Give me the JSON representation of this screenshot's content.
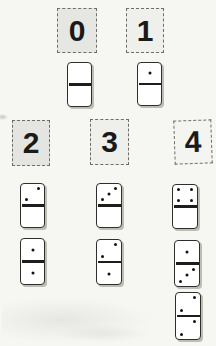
{
  "colors": {
    "background": "#f6f6f3",
    "card_border": "#6e6e68",
    "number": "#1a1a1a",
    "domino_border": "#2e2e2a",
    "domino_face": "#ffffff",
    "divider": "#1d1d1a",
    "pip": "#121212",
    "shadow": "#bdbdb6"
  },
  "cards": [
    {
      "label": "0",
      "x": 57,
      "y": 8,
      "w": 40,
      "h": 45,
      "bg": "#e6e6e2",
      "tilt": 0
    },
    {
      "label": "1",
      "x": 126,
      "y": 8,
      "w": 38,
      "h": 45,
      "bg": "#efefeb",
      "tilt": 0
    },
    {
      "label": "2",
      "x": 12,
      "y": 120,
      "w": 38,
      "h": 46,
      "bg": "#e4e4e0",
      "tilt": 0
    },
    {
      "label": "3",
      "x": 90,
      "y": 119,
      "w": 39,
      "h": 46,
      "bg": "#eff0ec",
      "tilt": 0
    },
    {
      "label": "4",
      "x": 174,
      "y": 120,
      "w": 38,
      "h": 44,
      "bg": "#f4f4f0",
      "tilt": -2
    }
  ],
  "dominoes": [
    {
      "top": 0,
      "bottom": 0,
      "x": 67,
      "y": 62,
      "w": 25,
      "h": 45
    },
    {
      "top": 1,
      "bottom": 0,
      "x": 137,
      "y": 62,
      "w": 25,
      "h": 44
    },
    {
      "top": 2,
      "bottom": 0,
      "x": 20,
      "y": 183,
      "w": 25,
      "h": 45
    },
    {
      "top": 3,
      "bottom": 0,
      "x": 96,
      "y": 183,
      "w": 26,
      "h": 45
    },
    {
      "top": 4,
      "bottom": 0,
      "x": 172,
      "y": 184,
      "w": 26,
      "h": 45
    },
    {
      "top": 1,
      "bottom": 1,
      "x": 20,
      "y": 238,
      "w": 25,
      "h": 47
    },
    {
      "top": 2,
      "bottom": 1,
      "x": 96,
      "y": 239,
      "w": 26,
      "h": 46
    },
    {
      "top": 1,
      "bottom": 3,
      "x": 174,
      "y": 240,
      "w": 26,
      "h": 47
    },
    {
      "top": 2,
      "bottom": 2,
      "x": 175,
      "y": 292,
      "w": 26,
      "h": 48
    }
  ],
  "pip_layouts": {
    "0": [],
    "1": [
      "c"
    ],
    "2": [
      "tr",
      "bl"
    ],
    "3": [
      "tr",
      "c",
      "bl"
    ],
    "4": [
      "tl",
      "tr",
      "bl",
      "br"
    ]
  }
}
